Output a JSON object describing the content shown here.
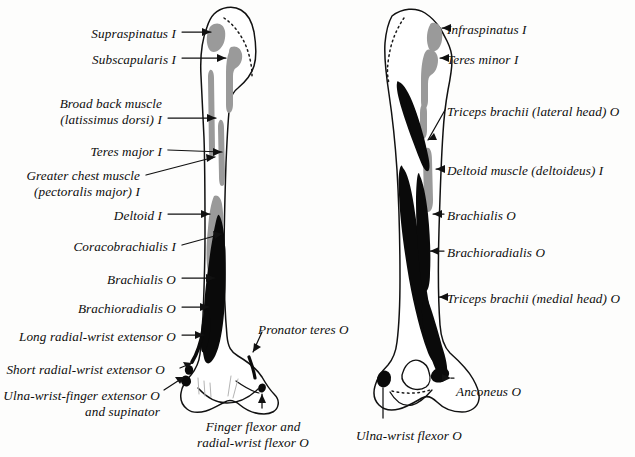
{
  "figure": {
    "view_left": "anterior view of right humerus",
    "view_right": "posterior view of right humerus",
    "legend_note": "I = insertion, O = origin",
    "colors": {
      "bone_outline": "#111111",
      "bone_fill": "#ffffff",
      "origin_black": "#0a0a0a",
      "insertion_gray": "#9a9a9a",
      "background": "#fdfdfc",
      "text": "#0d0d0d",
      "leader_line": "#111111"
    }
  },
  "labels_left": [
    {
      "id": "supraspinatus",
      "text": "Supraspinatus I",
      "align": "right",
      "x": 176,
      "y": 26
    },
    {
      "id": "subscapularis",
      "text": "Subscapularis I",
      "align": "right",
      "x": 176,
      "y": 52
    },
    {
      "id": "latissimus-dorsi",
      "text": "Broad back muscle\n(latissimus dorsi) I",
      "align": "right",
      "x": 162,
      "y": 96
    },
    {
      "id": "teres-major",
      "text": "Teres major I",
      "align": "right",
      "x": 162,
      "y": 144
    },
    {
      "id": "pectoralis-major",
      "text": "Greater chest muscle\n(pectoralis major) I",
      "align": "right",
      "x": 140,
      "y": 168
    },
    {
      "id": "deltoid-left",
      "text": "Deltoid I",
      "align": "right",
      "x": 162,
      "y": 208
    },
    {
      "id": "coracobrachialis",
      "text": "Coracobrachialis I",
      "align": "right",
      "x": 176,
      "y": 239
    },
    {
      "id": "brachialis-left",
      "text": "Brachialis O",
      "align": "right",
      "x": 176,
      "y": 272
    },
    {
      "id": "brachioradialis-left",
      "text": "Brachioradialis O",
      "align": "right",
      "x": 176,
      "y": 301
    },
    {
      "id": "long-radial-wrist-extensor",
      "text": "Long radial-wrist extensor O",
      "align": "right",
      "x": 176,
      "y": 329
    },
    {
      "id": "short-radial-wrist-extensor",
      "text": "Short radial-wrist extensor O",
      "align": "right",
      "x": 165,
      "y": 362
    },
    {
      "id": "ulna-wrist-finger-extensor",
      "text": "Ulna-wrist-finger extensor O\nand supinator",
      "align": "right",
      "x": 160,
      "y": 388
    }
  ],
  "labels_center": [
    {
      "id": "pronator-teres",
      "text": "Pronator teres O",
      "align": "left",
      "x": 258,
      "y": 322
    },
    {
      "id": "finger-radial-wrist-flexor",
      "text": "Finger flexor and\nradial-wrist flexor O",
      "align": "center",
      "x": 253,
      "y": 419
    }
  ],
  "labels_right": [
    {
      "id": "infraspinatus",
      "text": "Infraspinatus I",
      "align": "left",
      "x": 447,
      "y": 22
    },
    {
      "id": "teres-minor",
      "text": "Teres minor I",
      "align": "left",
      "x": 447,
      "y": 52
    },
    {
      "id": "triceps-lateral-head",
      "text": "Triceps brachii (lateral head) O",
      "align": "left",
      "x": 447,
      "y": 104
    },
    {
      "id": "deltoid-right",
      "text": "Deltoid muscle (deltoideus) I",
      "align": "left",
      "x": 447,
      "y": 163
    },
    {
      "id": "brachialis-right",
      "text": "Brachialis O",
      "align": "left",
      "x": 447,
      "y": 208
    },
    {
      "id": "brachioradialis-right",
      "text": "Brachioradialis O",
      "align": "left",
      "x": 447,
      "y": 245
    },
    {
      "id": "triceps-medial-head",
      "text": "Triceps brachii (medial head) O",
      "align": "left",
      "x": 447,
      "y": 291
    },
    {
      "id": "anconeus",
      "text": "Anconeus O",
      "align": "left",
      "x": 456,
      "y": 384
    },
    {
      "id": "ulna-wrist-flexor",
      "text": "Ulna-wrist flexor O",
      "align": "left",
      "x": 356,
      "y": 428
    }
  ]
}
